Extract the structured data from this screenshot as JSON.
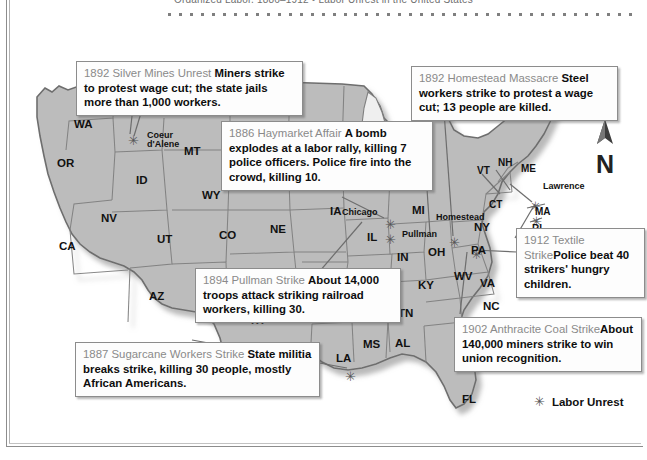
{
  "page": {
    "running_head": "Organized Labor, 1886–1912  •  Labor Unrest in the United States",
    "dot_count": 43
  },
  "map": {
    "title_icon": "north-arrow-icon",
    "north_label": "N",
    "legend": {
      "marker": "✳",
      "label": "Labor Unrest"
    },
    "state_labels": [
      {
        "abbr": "WA",
        "x": 62,
        "y": 96
      },
      {
        "abbr": "OR",
        "x": 45,
        "y": 135
      },
      {
        "abbr": "CA",
        "x": 47,
        "y": 218
      },
      {
        "abbr": "NV",
        "x": 89,
        "y": 190
      },
      {
        "abbr": "ID",
        "x": 124,
        "y": 152
      },
      {
        "abbr": "MT",
        "x": 172,
        "y": 123
      },
      {
        "abbr": "WY",
        "x": 190,
        "y": 167
      },
      {
        "abbr": "UT",
        "x": 145,
        "y": 211
      },
      {
        "abbr": "CO",
        "x": 207,
        "y": 207
      },
      {
        "abbr": "AZ",
        "x": 137,
        "y": 268
      },
      {
        "abbr": "NM",
        "x": 190,
        "y": 284
      },
      {
        "abbr": "TX",
        "x": 237,
        "y": 292
      },
      {
        "abbr": "SD",
        "x": 253,
        "y": 157
      },
      {
        "abbr": "NE",
        "x": 258,
        "y": 201
      },
      {
        "abbr": "MN",
        "x": 302,
        "y": 148
      },
      {
        "abbr": "IA",
        "x": 318,
        "y": 183
      },
      {
        "abbr": "WI",
        "x": 343,
        "y": 143
      },
      {
        "abbr": "IL",
        "x": 355,
        "y": 209
      },
      {
        "abbr": "MI",
        "x": 400,
        "y": 182
      },
      {
        "abbr": "IN",
        "x": 385,
        "y": 229
      },
      {
        "abbr": "OH",
        "x": 416,
        "y": 224
      },
      {
        "abbr": "KY",
        "x": 406,
        "y": 257
      },
      {
        "abbr": "TN",
        "x": 386,
        "y": 285
      },
      {
        "abbr": "OK",
        "x": 278,
        "y": 283
      },
      {
        "abbr": "AK",
        "x": 325,
        "y": 288
      },
      {
        "abbr": "MS",
        "x": 351,
        "y": 316
      },
      {
        "abbr": "AL",
        "x": 383,
        "y": 315
      },
      {
        "abbr": "LA",
        "x": 324,
        "y": 330
      },
      {
        "abbr": "FL",
        "x": 450,
        "y": 371
      },
      {
        "abbr": "WV",
        "x": 442,
        "y": 248
      },
      {
        "abbr": "VA",
        "x": 468,
        "y": 255
      },
      {
        "abbr": "NC",
        "x": 471,
        "y": 278
      },
      {
        "abbr": "PA",
        "x": 459,
        "y": 222
      },
      {
        "abbr": "NY",
        "x": 462,
        "y": 199
      },
      {
        "abbr": "CT",
        "x": 477,
        "y": 178
      },
      {
        "abbr": "VT",
        "x": 465,
        "y": 144
      },
      {
        "abbr": "NH",
        "x": 486,
        "y": 136
      },
      {
        "abbr": "ME",
        "x": 509,
        "y": 142
      },
      {
        "abbr": "MA",
        "x": 523,
        "y": 185
      },
      {
        "abbr": "RI",
        "x": 520,
        "y": 202
      }
    ],
    "city_labels": [
      {
        "name": "Coeur\nd'Alene",
        "x": 135,
        "y": 109
      },
      {
        "name": "Chicago",
        "x": 330,
        "y": 186
      },
      {
        "name": "Pullman",
        "x": 390,
        "y": 208
      },
      {
        "name": "Homestead",
        "x": 424,
        "y": 191
      },
      {
        "name": "Lawrence",
        "x": 531,
        "y": 160
      }
    ],
    "markers": [
      {
        "name": "coeur-dalene-marker",
        "x": 116,
        "y": 112
      },
      {
        "name": "chicago-marker",
        "x": 373,
        "y": 196
      },
      {
        "name": "pullman-marker",
        "x": 373,
        "y": 211
      },
      {
        "name": "homestead-marker",
        "x": 437,
        "y": 214
      },
      {
        "name": "pennsylvania-marker",
        "x": 459,
        "y": 226
      },
      {
        "name": "lawrence-marker",
        "x": 518,
        "y": 178
      },
      {
        "name": "rhodeisland-marker",
        "x": 519,
        "y": 193
      },
      {
        "name": "louisiana-marker",
        "x": 333,
        "y": 348
      }
    ]
  },
  "callouts": [
    {
      "id": "silver-mines-unrest",
      "title": "1892 Silver Mines Unrest ",
      "body": "Miners strike to protest wage cut; the state jails more than 1,000 workers.",
      "x": 64,
      "y": 39,
      "w": 227
    },
    {
      "id": "homestead-massacre",
      "title": "1892 Homestead Massacre ",
      "body": "Steel workers strike to protest a wage cut; 13 people are killed.",
      "x": 399,
      "y": 44,
      "w": 207
    },
    {
      "id": "haymarket-affair",
      "title": "1886 Haymarket Affair ",
      "body": "A bomb explodes at a labor rally, killing 7 police officers. Police fire into the crowd, killing 10.",
      "x": 209,
      "y": 99,
      "w": 212
    },
    {
      "id": "textile-strike",
      "title": "1912 Textile Strike",
      "body": "Police beat 40 strikers' hungry children.",
      "x": 504,
      "y": 206,
      "w": 129
    },
    {
      "id": "pullman-strike",
      "title": "1894 Pullman Strike ",
      "body": "About 14,000 troops attack striking railroad workers, killing 30.",
      "x": 183,
      "y": 246,
      "w": 206
    },
    {
      "id": "anthracite-coal-strike",
      "title": "1902 Anthracite Coal Strike",
      "body": "About 140,000 miners strike to win union recognition.",
      "x": 442,
      "y": 295,
      "w": 188
    },
    {
      "id": "sugarcane-workers-strike",
      "title": "1887 Sugarcane Workers Strike ",
      "body": "State militia breaks strike, killing 30 people, mostly African Americans.",
      "x": 63,
      "y": 320,
      "w": 245
    }
  ],
  "colors": {
    "land": "#b9b9b9",
    "land_light": "#c6c6c6",
    "border": "#7d7d7d",
    "outline": "#6e6e6e",
    "callout_title": "#8a8a8a",
    "marker": "#555555",
    "page_rule": "#8d8d8d"
  }
}
